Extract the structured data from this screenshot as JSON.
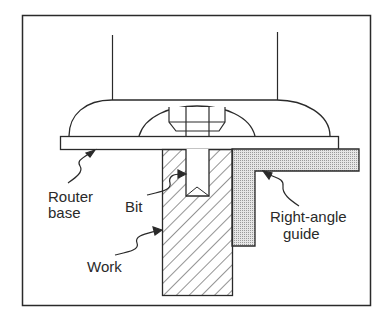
{
  "diagram": {
    "type": "technical-illustration",
    "labels": {
      "router_base": [
        "Router",
        "base"
      ],
      "bit": "Bit",
      "right_angle_guide": [
        "Right-angle",
        "guide"
      ],
      "work": "Work"
    },
    "colors": {
      "line": "#2a2a2a",
      "background": "#ffffff",
      "guide_fill": "#d4d4d4"
    }
  }
}
